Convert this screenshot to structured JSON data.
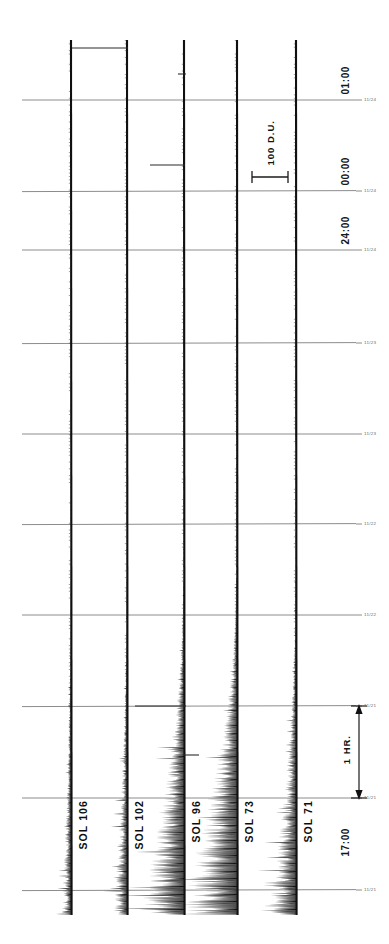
{
  "figure": {
    "kind": "strip-chart-recording",
    "background_color": "#ffffff",
    "ink_color": "#101010",
    "grid_color": "#8c8c8c",
    "width": 389,
    "height": 944
  },
  "annotations": {
    "amplitude_scale_label": "100 D.U.",
    "time_scale_label": "1 HR."
  },
  "time_labels": [
    {
      "text": "01:00",
      "y": 100
    },
    {
      "text": "00:00",
      "y": 191
    },
    {
      "text": "24:00",
      "y": 250
    },
    {
      "text": "17:00",
      "y": 862
    }
  ],
  "gridline_ticks": [
    {
      "text": "11/24",
      "y": 100
    },
    {
      "text": "11/24",
      "y": 191
    },
    {
      "text": "11/24",
      "y": 250
    },
    {
      "text": "11/23",
      "y": 343
    },
    {
      "text": "11/23",
      "y": 434
    },
    {
      "text": "11/22",
      "y": 524
    },
    {
      "text": "11/22",
      "y": 615
    },
    {
      "text": "11/21",
      "y": 706
    },
    {
      "text": "11/21",
      "y": 798
    },
    {
      "text": "11/21",
      "y": 890
    }
  ],
  "traces": [
    {
      "label": "SOL 106",
      "x": 71,
      "label_y": 845,
      "noise": 0.06
    },
    {
      "label": "SOL 102",
      "x": 127,
      "label_y": 845,
      "noise": 0.1
    },
    {
      "label": "SOL 96",
      "x": 184,
      "label_y": 845,
      "noise": 0.55
    },
    {
      "label": "SOL 73",
      "x": 237,
      "label_y": 845,
      "noise": 0.8
    },
    {
      "label": "SOL 71",
      "x": 296,
      "label_y": 845,
      "noise": 0.35
    }
  ],
  "chart_data": {
    "type": "line",
    "title": "",
    "subtitle": "",
    "xlabel": "",
    "ylabel": "",
    "orientation": "vertical-traces-time-down",
    "grid": true,
    "legend": "none",
    "amplitude_unit": "D.U.",
    "amplitude_scale_value": 100,
    "amplitude_scale_pixels": 36,
    "time_scale_label": "1 HR.",
    "time_scale_pixels": 92,
    "ylim_time": [
      "01:00",
      "17:00"
    ],
    "ytick_times": [
      "01:00",
      "00:00",
      "24:00",
      "17:00"
    ],
    "gridline_y": [
      100,
      191,
      250,
      343,
      434,
      524,
      615,
      706,
      798,
      890
    ],
    "gridline_date_ticks": [
      "11/24",
      "11/24",
      "11/24",
      "11/23",
      "11/23",
      "11/22",
      "11/22",
      "11/21",
      "11/21",
      "11/21"
    ],
    "trace_top_y": 40,
    "trace_bottom_y": 915,
    "series": [
      {
        "name": "SOL 106",
        "baseline_x": 71,
        "mean_amplitude": 3,
        "peak_amplitude": 10,
        "noise_level": 0.06
      },
      {
        "name": "SOL 102",
        "baseline_x": 127,
        "mean_amplitude": 4,
        "peak_amplitude": 14,
        "noise_level": 0.1
      },
      {
        "name": "SOL 96",
        "baseline_x": 184,
        "mean_amplitude": 9,
        "peak_amplitude": 46,
        "noise_level": 0.55
      },
      {
        "name": "SOL 73",
        "baseline_x": 237,
        "mean_amplitude": 12,
        "peak_amplitude": 62,
        "noise_level": 0.8
      },
      {
        "name": "SOL 71",
        "baseline_x": 296,
        "mean_amplitude": 6,
        "peak_amplitude": 28,
        "noise_level": 0.35
      }
    ],
    "event_markers": [
      {
        "description": "horizontal deflection bar from trace SOL 106 to SOL 102",
        "y": 48,
        "x_start": 72,
        "x_end": 128
      },
      {
        "description": "short horizontal deflection left of SOL 96",
        "y": 74,
        "x_start": 178,
        "x_end": 186
      },
      {
        "description": "horizontal deflection left of SOL 96",
        "y": 165,
        "x_start": 150,
        "x_end": 185
      },
      {
        "description": "horizontal deflection left of SOL 96 at 11/21 gridline",
        "y": 706,
        "x_start": 135,
        "x_end": 186
      },
      {
        "description": "short horizontal deflection left of SOL 96",
        "y": 755,
        "x_start": 183,
        "x_end": 199
      }
    ]
  }
}
